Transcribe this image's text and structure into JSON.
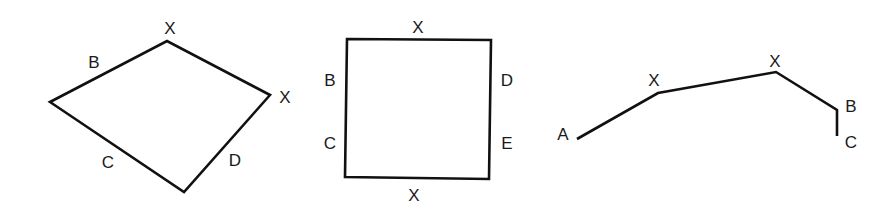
{
  "figures": [
    {
      "name": "kite-quadrilateral",
      "type": "closed-polygon",
      "points": "50,102 167,41 270,95 184,192",
      "labels": [
        {
          "id": "top-vertex",
          "text": "X",
          "x": 170,
          "y": 28
        },
        {
          "id": "upper-left-side",
          "text": "B",
          "x": 94,
          "y": 62
        },
        {
          "id": "right-vertex",
          "text": "X",
          "x": 285,
          "y": 97
        },
        {
          "id": "lower-left-side",
          "text": "C",
          "x": 108,
          "y": 162
        },
        {
          "id": "lower-right-side",
          "text": "D",
          "x": 235,
          "y": 160
        }
      ]
    },
    {
      "name": "square",
      "type": "closed-polygon",
      "points": "347,39 491,40 489,179 345,177",
      "labels": [
        {
          "id": "top-side",
          "text": "X",
          "x": 418,
          "y": 27
        },
        {
          "id": "left-side-upper",
          "text": "B",
          "x": 330,
          "y": 80
        },
        {
          "id": "right-side-upper",
          "text": "D",
          "x": 507,
          "y": 80
        },
        {
          "id": "left-side-lower",
          "text": "C",
          "x": 330,
          "y": 143
        },
        {
          "id": "right-side-lower",
          "text": "E",
          "x": 507,
          "y": 143
        },
        {
          "id": "bottom-side",
          "text": "X",
          "x": 414,
          "y": 195
        }
      ]
    },
    {
      "name": "open-polyline",
      "type": "open-polyline",
      "points": "577,139 658,93 776,72 837,110 837,136",
      "labels": [
        {
          "id": "start-point",
          "text": "A",
          "x": 563,
          "y": 134
        },
        {
          "id": "first-bend",
          "text": "X",
          "x": 654,
          "y": 80
        },
        {
          "id": "second-bend",
          "text": "X",
          "x": 775,
          "y": 61
        },
        {
          "id": "third-bend",
          "text": "B",
          "x": 851,
          "y": 106
        },
        {
          "id": "end-point",
          "text": "C",
          "x": 851,
          "y": 142
        }
      ]
    }
  ]
}
